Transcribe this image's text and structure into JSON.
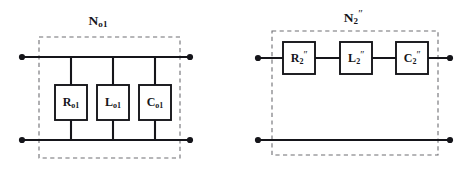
{
  "figure": {
    "kind": "two-one-port-network-schematics",
    "background_color": "#ffffff",
    "wire_color": "#15151a",
    "box_stroke_color": "#15151a",
    "dashed_border_color": "#6e6e73",
    "terminal_dot_color": "#15151a",
    "label_color": "#15151a"
  },
  "networks": [
    {
      "id": "left",
      "title": {
        "base": "N",
        "subscript": "o1",
        "superscript": "",
        "full_text": "No1"
      },
      "topology": "parallel",
      "components": [
        {
          "id": "r-o1",
          "base": "R",
          "subscript": "o1",
          "superscript": "",
          "full_text": "Ro1",
          "type": "resistor"
        },
        {
          "id": "l-o1",
          "base": "L",
          "subscript": "o1",
          "superscript": "",
          "full_text": "Lo1",
          "type": "inductor"
        },
        {
          "id": "c-o1",
          "base": "C",
          "subscript": "o1",
          "superscript": "",
          "full_text": "Co1",
          "type": "capacitor"
        }
      ],
      "terminals": [
        {
          "id": "left-top-terminal",
          "position": "top-left"
        },
        {
          "id": "left-bottom-terminal",
          "position": "bottom-left"
        },
        {
          "id": "right-top-terminal",
          "position": "top-right"
        },
        {
          "id": "right-bottom-terminal",
          "position": "bottom-right"
        }
      ]
    },
    {
      "id": "right",
      "title": {
        "base": "N",
        "subscript": "2",
        "superscript": "″",
        "full_text": "N2″"
      },
      "topology": "series",
      "components": [
        {
          "id": "r-2pp",
          "base": "R",
          "subscript": "2",
          "superscript": "″",
          "full_text": "R2″",
          "type": "resistor"
        },
        {
          "id": "l-2pp",
          "base": "L",
          "subscript": "2",
          "superscript": "″",
          "full_text": "L2″",
          "type": "inductor"
        },
        {
          "id": "c-2pp",
          "base": "C",
          "subscript": "2",
          "superscript": "″",
          "full_text": "C2″",
          "type": "capacitor"
        }
      ],
      "terminals": [
        {
          "id": "left-top-terminal",
          "position": "top-left"
        },
        {
          "id": "left-bottom-terminal",
          "position": "bottom-left"
        },
        {
          "id": "right-top-terminal",
          "position": "top-right"
        },
        {
          "id": "right-bottom-terminal",
          "position": "bottom-right"
        }
      ]
    }
  ]
}
